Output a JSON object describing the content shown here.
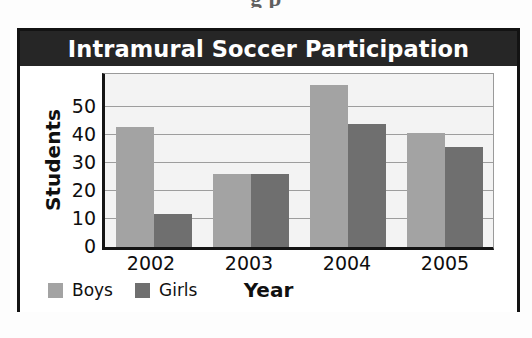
{
  "page": {
    "bleed_text_above": "g p"
  },
  "chart": {
    "title": "Intramural Soccer Participation",
    "xlabel": "Year",
    "ylabel": "Students",
    "legend": [
      {
        "label": "Boys",
        "color": "#a3a3a3"
      },
      {
        "label": "Girls",
        "color": "#6f6f6f"
      }
    ],
    "colors": {
      "title_bar": "#262626",
      "title_text": "#ffffff",
      "plot_background": "#f3f3f3",
      "gridline": "#9d9d9d",
      "axis": "#141414",
      "frame": "#131313",
      "boys": "#a3a3a3",
      "girls": "#6f6f6f"
    }
  },
  "chart_data": {
    "type": "bar",
    "title": "Intramural Soccer Participation",
    "xlabel": "Year",
    "ylabel": "Students",
    "categories": [
      "2002",
      "2003",
      "2004",
      "2005"
    ],
    "series": [
      {
        "name": "Boys",
        "color": "#a3a3a3",
        "values": [
          43,
          26,
          58,
          41
        ]
      },
      {
        "name": "Girls",
        "color": "#6f6f6f",
        "values": [
          12,
          26,
          44,
          36
        ]
      }
    ],
    "ylim": [
      0,
      62
    ],
    "yticks": [
      0,
      10,
      20,
      30,
      40,
      50
    ],
    "ytick_labels": [
      "0",
      "10",
      "20",
      "30",
      "40",
      "50"
    ],
    "grid": true,
    "grid_axis": "y",
    "legend_position": "bottom-left",
    "grouped": true
  }
}
